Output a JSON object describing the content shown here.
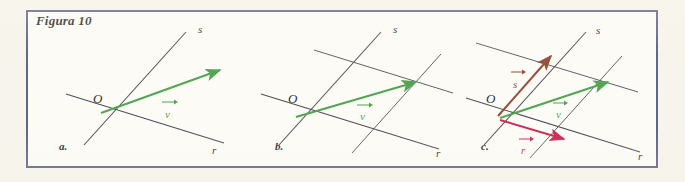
{
  "figure": {
    "title": "Figura 10",
    "border_color": "#4a5480",
    "page_background": "#f6f4ec",
    "panel_background": "#fdfcf7"
  },
  "colors": {
    "line": "#3b3b47",
    "vector_v": "#3f9b3f",
    "vector_r": "#cc1144",
    "vector_s": "#8a3a22",
    "label_dark": "#12121a"
  },
  "panels": [
    {
      "id": "a",
      "letter": "a.",
      "caption_letter": "a.",
      "lines": [
        {
          "name": "s",
          "label": "s"
        },
        {
          "name": "r",
          "label": "r"
        }
      ],
      "origin_label": "O",
      "vectors": [
        {
          "name": "v",
          "label": "v",
          "color": "#3f9b3f"
        }
      ]
    },
    {
      "id": "b",
      "letter": "b.",
      "caption_letter": "b.",
      "lines": [
        {
          "name": "s",
          "label": "s"
        },
        {
          "name": "r",
          "label": "r"
        }
      ],
      "origin_label": "O",
      "vectors": [
        {
          "name": "v",
          "label": "v",
          "color": "#3f9b3f"
        }
      ],
      "grid": "parallel rulings to r and s"
    },
    {
      "id": "c",
      "letter": "c.",
      "caption_letter": "c.",
      "lines": [
        {
          "name": "s",
          "label": "s"
        },
        {
          "name": "r",
          "label": "r"
        }
      ],
      "origin_label": "O",
      "vectors": [
        {
          "name": "s",
          "label": "s",
          "color": "#8a3a22"
        },
        {
          "name": "v",
          "label": "v",
          "color": "#3f9b3f"
        },
        {
          "name": "r",
          "label": "r",
          "color": "#cc1144"
        }
      ],
      "grid": "parallel rulings to r and s"
    }
  ]
}
